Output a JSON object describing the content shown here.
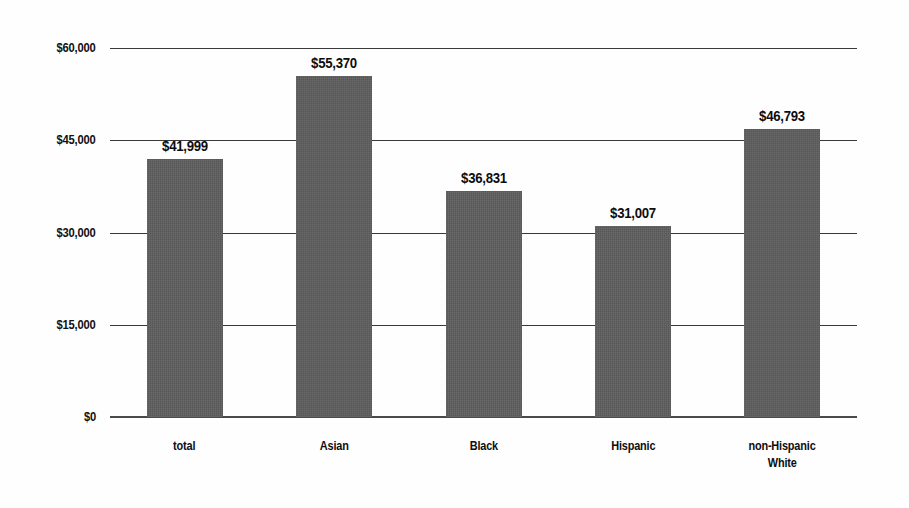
{
  "chart_data": {
    "type": "bar",
    "title": "",
    "subtitle": "",
    "xlabel": "",
    "ylabel": "",
    "categories": [
      "total",
      "Asian",
      "Black",
      "Hispanic",
      "non-Hispanic White"
    ],
    "category_lines": [
      [
        "total"
      ],
      [
        "Asian"
      ],
      [
        "Black"
      ],
      [
        "Hispanic"
      ],
      [
        "non-Hispanic",
        "White"
      ]
    ],
    "values": [
      41999,
      55370,
      36831,
      31007,
      46793
    ],
    "value_labels": [
      "$41,999",
      "$55,370",
      "$36,831",
      "$31,007",
      "$46,793"
    ],
    "ylim": [
      0,
      60000
    ],
    "yticks": [
      0,
      15000,
      30000,
      45000,
      60000
    ],
    "ytick_labels": [
      "$0",
      "$15,000",
      "$30,000",
      "$45,000",
      "$60,000"
    ],
    "grid": true,
    "legend": "none",
    "bar_color": "#575757",
    "gridline_color": "#3a3a3a",
    "text_color": "#0d0d0d",
    "background_color": "#ffffff"
  }
}
